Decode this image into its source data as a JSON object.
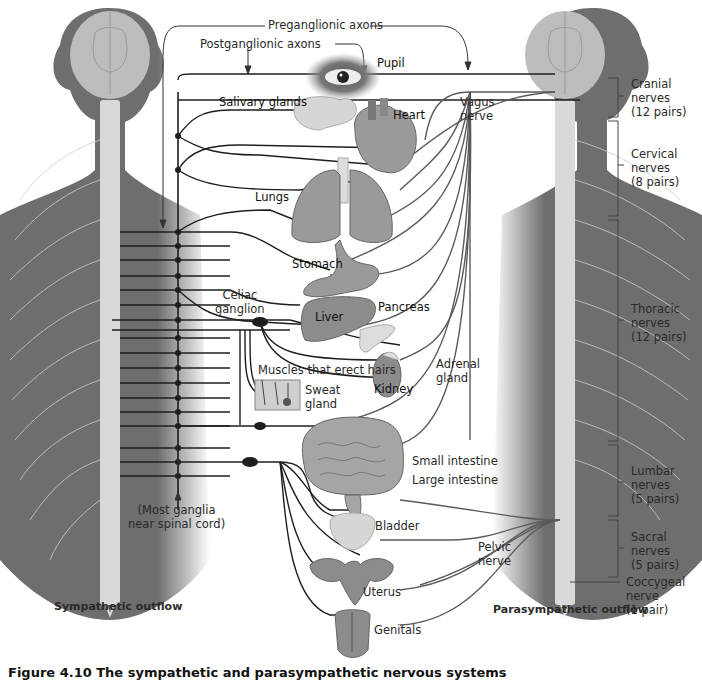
{
  "colors": {
    "body_dark": "#6e6e6e",
    "body_mid": "#8c8c8c",
    "brain": "#bdbdbd",
    "spine": "#d9d9d9",
    "nerve_line": "#1e1e1e",
    "para_line": "#5a5a5a",
    "organ": "#9a9a9a",
    "organ_light": "#cfcfcf",
    "background": "#ffffff"
  },
  "labels": {
    "preganglionic": "Preganglionic axons",
    "postganglionic": "Postganglionic axons",
    "pupil": "Pupil",
    "salivary": "Salivary glands",
    "heart": "Heart",
    "vagus_1": "Vagus",
    "vagus_2": "nerve",
    "lungs": "Lungs",
    "stomach": "Stomach",
    "celiac_1": "Celiac",
    "celiac_2": "ganglion",
    "liver": "Liver",
    "pancreas": "Pancreas",
    "muscles_hairs": "Muscles that erect hairs",
    "sweat_1": "Sweat",
    "sweat_2": "gland",
    "kidney": "Kidney",
    "adrenal_1": "Adrenal",
    "adrenal_2": "gland",
    "small_intestine": "Small intestine",
    "large_intestine": "Large intestine",
    "most_ganglia_1": "(Most ganglia",
    "most_ganglia_2": "near spinal cord)",
    "bladder": "Bladder",
    "pelvic_1": "Pelvic",
    "pelvic_2": "nerve",
    "uterus": "Uterus",
    "genitals": "Genitals",
    "sympathetic_outflow": "Sympathetic outflow",
    "parasympathetic_outflow": "Parasympathetic outflow"
  },
  "spinal_groups": [
    {
      "name": "Cranial",
      "line2": "nerves",
      "line3": "(12 pairs)"
    },
    {
      "name": "Cervical",
      "line2": "nerves",
      "line3": "(8 pairs)"
    },
    {
      "name": "Thoracic",
      "line2": "nerves",
      "line3": "(12 pairs)"
    },
    {
      "name": "Lumbar",
      "line2": "nerves",
      "line3": "(5 pairs)"
    },
    {
      "name": "Sacral",
      "line2": "nerves",
      "line3": "(5 pairs)"
    },
    {
      "name": "Coccygeal",
      "line2": "nerve",
      "line3": "(1 pair)"
    }
  ],
  "caption": "Figure 4.10  The sympathetic and parasympathetic nervous systems"
}
